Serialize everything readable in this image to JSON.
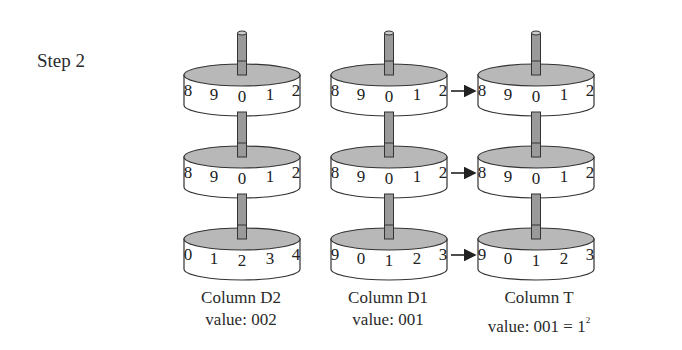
{
  "step": {
    "label": "Step 2"
  },
  "columns": [
    {
      "id": "D2",
      "title": "Column D2",
      "value_text": "value: 002",
      "wheels": [
        {
          "digits": [
            "8",
            "9",
            "0",
            "1",
            "2"
          ]
        },
        {
          "digits": [
            "8",
            "9",
            "0",
            "1",
            "2"
          ]
        },
        {
          "digits": [
            "0",
            "1",
            "2",
            "3",
            "4"
          ]
        }
      ]
    },
    {
      "id": "D1",
      "title": "Column D1",
      "value_text": "value: 001",
      "wheels": [
        {
          "digits": [
            "8",
            "9",
            "0",
            "1",
            "2"
          ]
        },
        {
          "digits": [
            "8",
            "9",
            "0",
            "1",
            "2"
          ]
        },
        {
          "digits": [
            "9",
            "0",
            "1",
            "2",
            "3"
          ]
        }
      ]
    },
    {
      "id": "T",
      "title": "Column T",
      "value_text": "value: 001 = 1",
      "value_superscript": "2",
      "wheels": [
        {
          "digits": [
            "8",
            "9",
            "0",
            "1",
            "2"
          ]
        },
        {
          "digits": [
            "8",
            "9",
            "0",
            "1",
            "2"
          ]
        },
        {
          "digits": [
            "9",
            "0",
            "1",
            "2",
            "3"
          ]
        }
      ]
    }
  ],
  "arrows": [
    {
      "from": "D1",
      "to": "T",
      "row": 0
    },
    {
      "from": "D1",
      "to": "T",
      "row": 1
    },
    {
      "from": "D1",
      "to": "T",
      "row": 2
    }
  ],
  "colors": {
    "wheel_top": "#b8b8b8",
    "wheel_side": "#ffffff",
    "stroke": "#333333",
    "axle": "#9a9a9a"
  }
}
